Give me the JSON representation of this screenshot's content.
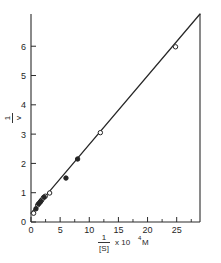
{
  "chart_data": {
    "type": "scatter",
    "title": "",
    "subtitle": "",
    "plot_kind": "Lineweaver-Burk double reciprocal plot",
    "xlabel_parts": {
      "numerator": "1",
      "denominator": "[S]",
      "multiplier": "x 10",
      "exponent": "4",
      "units": "M"
    },
    "xlabel": "1/[S] x 10^4 M",
    "ylabel_parts": {
      "numerator": "1",
      "denominator": "v"
    },
    "ylabel": "1/v",
    "xlim": [
      0,
      29
    ],
    "ylim": [
      0,
      7.1
    ],
    "xticks": [
      0,
      5,
      10,
      15,
      20,
      25
    ],
    "xtick_labels": [
      "0",
      "5",
      "10",
      "15",
      "20",
      "25"
    ],
    "xminor_ticks": [
      2.5,
      7.5,
      12.5,
      17.5,
      22.5,
      27.5
    ],
    "yticks": [
      0,
      1,
      2,
      3,
      4,
      5,
      6
    ],
    "ytick_labels": [
      "0",
      "1",
      "2",
      "3",
      "4",
      "5",
      "6"
    ],
    "grid": false,
    "legend": false,
    "legend_position": "none",
    "fit_line": {
      "name": "linear regression",
      "intercept": 0.3,
      "slope": 0.2345,
      "x_start": 0,
      "x_end": 29,
      "y_start": 0.3,
      "y_end": 7.1
    },
    "series": [
      {
        "name": "open circles",
        "marker": "open-circle",
        "points": [
          {
            "x": 0.45,
            "y": 0.3
          },
          {
            "x": 1.15,
            "y": 0.58
          },
          {
            "x": 1.5,
            "y": 0.66
          },
          {
            "x": 1.8,
            "y": 0.74
          },
          {
            "x": 2.1,
            "y": 0.82
          },
          {
            "x": 2.45,
            "y": 0.88
          },
          {
            "x": 3.2,
            "y": 0.99
          },
          {
            "x": 11.9,
            "y": 3.05
          },
          {
            "x": 24.8,
            "y": 5.98
          }
        ]
      },
      {
        "name": "filled circles",
        "marker": "filled-circle",
        "points": [
          {
            "x": 0.85,
            "y": 0.45
          },
          {
            "x": 1.3,
            "y": 0.62
          },
          {
            "x": 1.65,
            "y": 0.7
          },
          {
            "x": 2.25,
            "y": 0.85
          },
          {
            "x": 6.0,
            "y": 1.5
          },
          {
            "x": 8.0,
            "y": 2.15
          }
        ]
      }
    ]
  }
}
